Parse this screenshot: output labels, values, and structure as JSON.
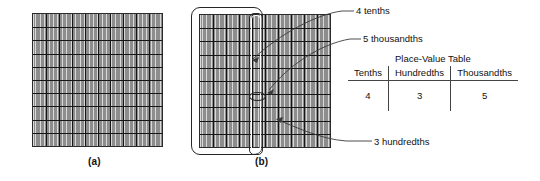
{
  "figure": {
    "captions": {
      "a": "(a)",
      "b": "(b)"
    },
    "annotations": {
      "tenths": "4 tenths",
      "thousandths": "5 thousandths",
      "hundredths": "3 hundredths"
    }
  },
  "place_value_table": {
    "title": "Place-Value Table",
    "headers": [
      "Tenths",
      "Hundredths",
      "Thousandths"
    ],
    "values": [
      "4",
      "3",
      "5"
    ]
  },
  "colors": {
    "grid_fill": "#d9d9d9",
    "grid_major_line": "#161616",
    "grid_minor_line": "#8d8d8d",
    "outline": "#262626",
    "text": "#111111"
  },
  "grid_spec": {
    "major_columns": 10,
    "major_rows": 10,
    "minor_columns_per_major": 10
  }
}
